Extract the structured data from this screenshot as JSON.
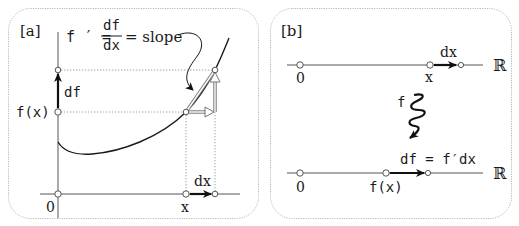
{
  "panel_a": {
    "label": "[a]",
    "formula": {
      "lhs": "f ′ =",
      "numerator": "df",
      "denominator": "dx",
      "rhs": "= slope"
    },
    "y_axis_labels": {
      "fx": "f(x)",
      "df": "df"
    },
    "x_axis_labels": {
      "origin": "0",
      "x": "x",
      "dx": "dx"
    }
  },
  "panel_b": {
    "label": "[b]",
    "top_line": {
      "origin": "0",
      "x": "x",
      "dx": "dx",
      "space": "ℝ"
    },
    "map_label": "f",
    "bottom_line": {
      "origin": "0",
      "fx": "f(x)",
      "df_eq": "df = f′dx",
      "space": "ℝ"
    }
  },
  "colors": {
    "ink": "#1a1a1a",
    "axis": "#555555",
    "guide": "#9a9a9a",
    "border": "#b5b5b5",
    "hollow_arrow": "#777777"
  }
}
